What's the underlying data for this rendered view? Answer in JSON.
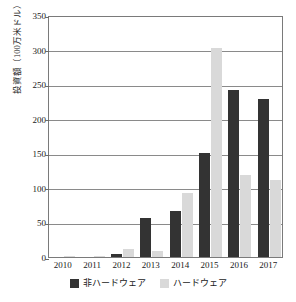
{
  "chart_data": {
    "type": "bar",
    "title": "",
    "xlabel": "",
    "ylabel": "投資額（100万米ドル）",
    "categories": [
      "2010",
      "2011",
      "2012",
      "2013",
      "2014",
      "2015",
      "2016",
      "2017"
    ],
    "series": [
      {
        "name": "非ハードウェア",
        "color": "#333333",
        "values": [
          0,
          0,
          4,
          57,
          67,
          150,
          241,
          228
        ]
      },
      {
        "name": "ハードウェア",
        "color": "#d9d9d9",
        "values": [
          1,
          1,
          11,
          8,
          93,
          302,
          119,
          111
        ]
      }
    ],
    "ylim": [
      0,
      350
    ],
    "yticks": [
      0,
      50,
      100,
      150,
      200,
      250,
      300,
      350
    ],
    "ytick_labels": [
      "0",
      "50",
      "100",
      "150",
      "200",
      "250",
      "300",
      "350"
    ],
    "grid": "horizontal",
    "legend_position": "bottom-center"
  },
  "legend": {
    "items": [
      {
        "label": "非ハードウェア",
        "color": "#333333"
      },
      {
        "label": "ハードウェア",
        "color": "#d9d9d9"
      }
    ]
  },
  "colors": {
    "non_hardware": "#333333",
    "hardware": "#d9d9d9",
    "axis": "#7a7a7a",
    "gridline": "#8a8a8a",
    "text": "#1a1a1a",
    "background": "#ffffff"
  }
}
